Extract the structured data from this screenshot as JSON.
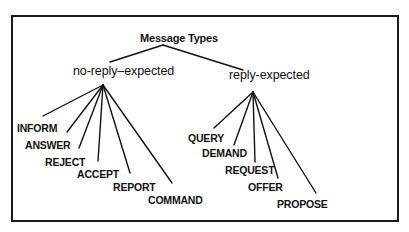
{
  "diagram": {
    "type": "tree",
    "frame": {
      "x": 11,
      "y": 15,
      "w": 386,
      "h": 205,
      "border_color": "#1a1a1a"
    },
    "root": {
      "label": "Message Types",
      "x": 140,
      "y": 38,
      "apex": [
        163,
        45
      ]
    },
    "branches": [
      {
        "label": "no-reply–expected",
        "x": 73,
        "y": 71,
        "link_top": [
          110,
          62
        ],
        "apex": [
          103,
          85
        ],
        "leaves": [
          {
            "label": "INFORM",
            "x": 17,
            "y": 128,
            "line_end": [
              43,
              116
            ]
          },
          {
            "label": "ANSWER",
            "x": 25,
            "y": 145,
            "line_end": [
              67,
              132
            ]
          },
          {
            "label": "REJECT",
            "x": 45,
            "y": 162,
            "line_end": [
              79,
              148
            ]
          },
          {
            "label": "ACCEPT",
            "x": 77,
            "y": 174,
            "line_end": [
              98,
              161
            ]
          },
          {
            "label": "REPORT",
            "x": 113,
            "y": 187,
            "line_end": [
              130,
              173
            ]
          },
          {
            "label": "COMMAND",
            "x": 148,
            "y": 200,
            "line_end": [
              172,
              183
            ]
          }
        ]
      },
      {
        "label": "reply-expected",
        "x": 229,
        "y": 75,
        "link_top": [
          243,
          70
        ],
        "apex": [
          253,
          92
        ],
        "leaves": [
          {
            "label": "QUERY",
            "x": 188,
            "y": 138,
            "line_end": [
              214,
              128
            ]
          },
          {
            "label": "DEMAND",
            "x": 202,
            "y": 153,
            "line_end": [
              234,
              145
            ]
          },
          {
            "label": "REQUEST",
            "x": 225,
            "y": 170,
            "line_end": [
              255,
              162
            ]
          },
          {
            "label": "OFFER",
            "x": 248,
            "y": 187,
            "line_end": [
              278,
              178
            ]
          },
          {
            "label": "PROPOSE",
            "x": 277,
            "y": 204,
            "line_end": [
              316,
              193
            ]
          }
        ]
      }
    ]
  }
}
